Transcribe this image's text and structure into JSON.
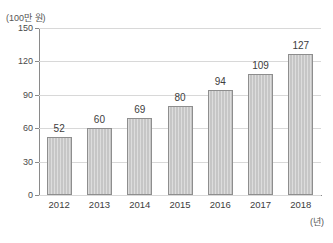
{
  "chart_data": {
    "type": "bar",
    "title": "",
    "xlabel": "(년)",
    "ylabel": "(100만 원)",
    "categories": [
      "2012",
      "2013",
      "2014",
      "2015",
      "2016",
      "2017",
      "2018"
    ],
    "values": [
      52,
      60,
      69,
      80,
      94,
      109,
      127
    ],
    "ylim": [
      0,
      150
    ],
    "yticks": [
      0,
      30,
      60,
      90,
      120,
      150
    ],
    "ytick_labels": [
      "0",
      "30",
      "60",
      "90",
      "120",
      "150"
    ],
    "grid": true,
    "legend": null,
    "data_labels": [
      "52",
      "60",
      "69",
      "80",
      "94",
      "109",
      "127"
    ],
    "colors": {
      "bar_fill": "#c6c6c6",
      "bar_border": "#8e8e8e",
      "gridline": "#d8d8d8",
      "axis": "#8a8a8a",
      "text": "#3d3d3d",
      "background": "#ffffff"
    }
  }
}
